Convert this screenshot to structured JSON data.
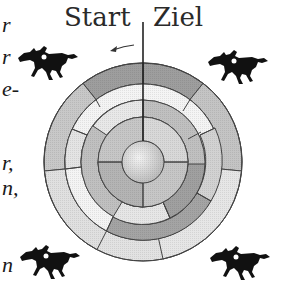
{
  "labels": {
    "start": "Start",
    "finish": "Ziel"
  },
  "left_text_fragments": [
    "r",
    "r",
    "e-",
    "r,",
    "n,",
    "n"
  ],
  "direction_arrow": "counter-clockwise",
  "board": {
    "type": "concentric ring race track",
    "rings": 4,
    "center_disk": true
  },
  "icons": [
    "horse-rider-icon",
    "horse-rider-icon",
    "horse-rider-icon",
    "horse-rider-icon"
  ],
  "colors": {
    "dark_ring": "#9a9a9a",
    "mid_ring": "#b8b8b8",
    "light_ring": "#dcdcdc",
    "lines": "#333333"
  }
}
